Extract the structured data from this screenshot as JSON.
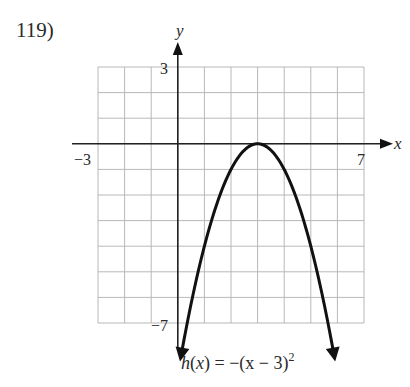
{
  "problem": {
    "number": "119)"
  },
  "chart_data": {
    "type": "line",
    "title": "",
    "function_label": "h(x) = −(x − 3)²",
    "equation": {
      "lhs_fn": "h",
      "lhs_var": "x",
      "equals": "=",
      "rhs": "−(x − 3)",
      "exponent": "2"
    },
    "xlabel": "x",
    "ylabel": "y",
    "xlim": [
      -3,
      7
    ],
    "ylim": [
      -7,
      3
    ],
    "x_tick_labels": [
      "−3",
      "7"
    ],
    "y_tick_labels": [
      "3",
      "−7"
    ],
    "grid": true,
    "grid_step": 1,
    "vertex": [
      3,
      0
    ],
    "series": [
      {
        "name": "h(x) = −(x − 3)²",
        "x": [
          0.2,
          0.5,
          1,
          1.5,
          2,
          2.5,
          3,
          3.5,
          4,
          4.5,
          5,
          5.5,
          5.8
        ],
        "values": [
          -7.84,
          -6.25,
          -4,
          -2.25,
          -1,
          -0.25,
          0,
          -0.25,
          -1,
          -2.25,
          -4,
          -6.25,
          -7.84
        ]
      }
    ],
    "annotations": [
      "arrows on both ends of curve",
      "arrows on positive x and y axes"
    ]
  },
  "labels": {
    "x_axis": "x",
    "y_axis": "y",
    "x_min": "−3",
    "x_max": "7",
    "y_max": "3",
    "y_min": "−7"
  }
}
